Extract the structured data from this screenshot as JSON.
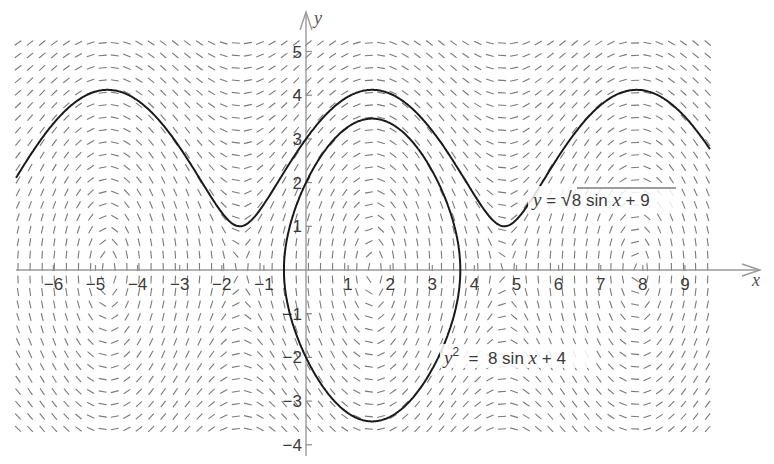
{
  "chart_data": {
    "type": "direction_field",
    "title": "",
    "differential_equation": "dy/dx = 4 cos x / y",
    "xlabel": "x",
    "ylabel": "y",
    "xlim": [
      -6.9,
      9.8
    ],
    "ylim": [
      -4.3,
      5.4
    ],
    "x_ticks": [
      -6,
      -5,
      -4,
      -3,
      -2,
      -1,
      1,
      2,
      3,
      4,
      5,
      6,
      7,
      8,
      9
    ],
    "x_tick_labels": [
      "−6",
      "−5",
      "−4",
      "−3",
      "−2",
      "−1",
      "1",
      "2",
      "3",
      "4",
      "5",
      "6",
      "7",
      "8",
      "9"
    ],
    "y_ticks": [
      -4,
      -3,
      -2,
      -1,
      1,
      2,
      3,
      4,
      5
    ],
    "y_tick_labels": [
      "−4",
      "−3",
      "−2",
      "−1",
      "1",
      "2",
      "3",
      "4",
      "5"
    ],
    "grid": false,
    "legend": null,
    "series": [
      {
        "name": "y = √(8 sin x + 9)",
        "type": "line",
        "formula": "sqrt(8*sin(x)+9)",
        "x_range": [
          -6.9,
          9.8
        ],
        "y_max": 4.12,
        "y_min": 1.0,
        "label": {
          "text_prefix": "y = ",
          "radical": "√",
          "radicand": "8 sin x + 9"
        }
      },
      {
        "name": "y² = 8 sin x + 4",
        "type": "closed_curve",
        "formula": "y^2 = 8*sin(x)+4",
        "x_range": [
          -0.5236,
          3.6652
        ],
        "y_max": 3.46,
        "y_min": -3.46,
        "label": {
          "base": "y",
          "exp": "2",
          "rest": " = 8 sin x + 4"
        }
      }
    ],
    "field": {
      "x_start": 18,
      "x_end": 710,
      "x_step": 12.1,
      "y_start": 43,
      "y_end": 441,
      "y_step": 12.45,
      "segment_length": 8
    }
  },
  "layout": {
    "origin_px": [
      306,
      270
    ],
    "px_per_unit_x": 42.1,
    "px_per_unit_y": 43.7,
    "axis_color": "#999999",
    "curve_color": "#1a1a1a",
    "field_color": "#7a7a7a"
  },
  "labels": {
    "x_axis": "x",
    "y_axis": "y",
    "upper_curve_prefix": "y = ",
    "upper_curve_radicand": "8 sin ",
    "upper_curve_x": "x",
    "upper_curve_tail": " + 9",
    "lower_curve_y": "y",
    "lower_curve_exp": "2",
    "lower_curve_rest": "  =  8 sin ",
    "lower_curve_x": "x",
    "lower_curve_tail": " + 4"
  }
}
